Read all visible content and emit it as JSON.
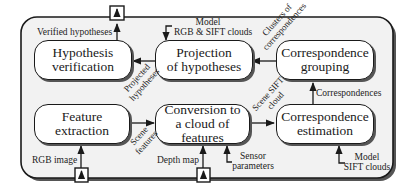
{
  "diagram": {
    "colors": {
      "stroke": "#1a1a1a",
      "container_fill": "#f2f2f2",
      "box_fill": "#ffffff"
    },
    "nodes": {
      "hypothesis_verification": {
        "line1": "Hypothesis",
        "line2": "verification"
      },
      "projection_of_hypotheses": {
        "line1": "Projection",
        "line2": "of hypotheses"
      },
      "correspondence_grouping": {
        "line1": "Correspondence",
        "line2": "grouping"
      },
      "feature_extraction": {
        "line1": "Feature",
        "line2": "extraction"
      },
      "conversion_to_cloud": {
        "line1": "Conversion to",
        "line2": "a cloud of features"
      },
      "correspondence_estimation": {
        "line1": "Correspondence",
        "line2": "estimation"
      }
    },
    "edge_labels": {
      "verified_hypotheses": "Verified hypotheses",
      "model_rgb_sift_line1": "Model",
      "model_rgb_sift_line2": "RGB & SIFT clouds",
      "clusters_line1": "Clusters of",
      "clusters_line2": "correspondences",
      "projected_line1": "Projected",
      "projected_line2": "hypotheses",
      "correspondences": "Correspondences",
      "scene_sift_line1": "Scene SIFT",
      "scene_sift_line2": "cloud",
      "scene_features_line1": "Scene",
      "scene_features_line2": "features",
      "rgb_image": "RGB image",
      "depth_map": "Depth map",
      "sensor_line1": "Sensor",
      "sensor_line2": "parameters",
      "model_sift_line1": "Model",
      "model_sift_line2": "SIFT clouds"
    },
    "ports": [
      {
        "name": "output-port-verified-hypotheses",
        "direction": "up"
      },
      {
        "name": "input-port-rgb-image",
        "direction": "up"
      },
      {
        "name": "input-port-depth-map",
        "direction": "up"
      }
    ]
  }
}
